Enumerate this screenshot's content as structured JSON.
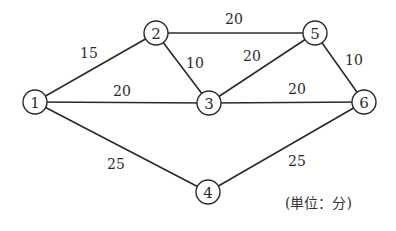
{
  "diagram": {
    "type": "weighted-network",
    "unit_note": "(単位：分)",
    "nodes": [
      {
        "id": "1",
        "label": "1"
      },
      {
        "id": "2",
        "label": "2"
      },
      {
        "id": "3",
        "label": "3"
      },
      {
        "id": "4",
        "label": "4"
      },
      {
        "id": "5",
        "label": "5"
      },
      {
        "id": "6",
        "label": "6"
      }
    ],
    "edges": [
      {
        "from": "1",
        "to": "2",
        "weight": "15"
      },
      {
        "from": "1",
        "to": "3",
        "weight": "20"
      },
      {
        "from": "1",
        "to": "4",
        "weight": "25"
      },
      {
        "from": "2",
        "to": "3",
        "weight": "10"
      },
      {
        "from": "2",
        "to": "5",
        "weight": "20"
      },
      {
        "from": "3",
        "to": "5",
        "weight": "20"
      },
      {
        "from": "3",
        "to": "6",
        "weight": "20"
      },
      {
        "from": "5",
        "to": "6",
        "weight": "10"
      },
      {
        "from": "4",
        "to": "6",
        "weight": "25"
      }
    ]
  }
}
